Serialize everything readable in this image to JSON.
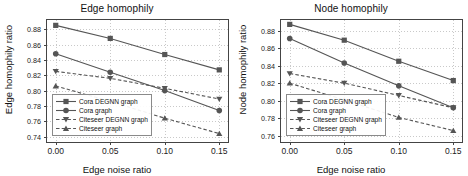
{
  "figure": {
    "panels": [
      {
        "id": "edge-homophily",
        "title": "Edge homophily",
        "xlabel": "Edge noise ratio",
        "ylabel": "Edge homophily ratio",
        "xticks": [
          "0.00",
          "0.05",
          "0.10",
          "0.15"
        ],
        "yticks": [
          "0.88",
          "0.86",
          "0.84",
          "0.82",
          "0.80",
          "0.78",
          "0.76",
          "0.74"
        ]
      },
      {
        "id": "node-homophily",
        "title": "Node homophily",
        "xlabel": "Edge noise ratio",
        "ylabel": "Node homophily ratio",
        "xticks": [
          "0.00",
          "0.05",
          "0.10",
          "0.15"
        ],
        "yticks": [
          "0.88",
          "0.86",
          "0.84",
          "0.82",
          "0.80",
          "0.78",
          "0.76"
        ]
      }
    ],
    "legend": [
      {
        "label": "Cora DEGNN graph",
        "marker": "square",
        "line": "solid",
        "color": "#555555"
      },
      {
        "label": "Cora graph",
        "marker": "circle",
        "line": "solid",
        "color": "#555555"
      },
      {
        "label": "Citeseer DEGNN graph",
        "marker": "triangle-down",
        "line": "dashed",
        "color": "#555555"
      },
      {
        "label": "Citeseer graph",
        "marker": "triangle-up",
        "line": "dashed",
        "color": "#555555"
      }
    ]
  },
  "chart_data": [
    {
      "type": "line",
      "title": "Edge homophily",
      "xlabel": "Edge noise ratio",
      "ylabel": "Edge homophily ratio",
      "x": [
        0.0,
        0.05,
        0.1,
        0.15
      ],
      "xlim": [
        -0.008,
        0.158
      ],
      "ylim": [
        0.733,
        0.892
      ],
      "grid": true,
      "legend_position": "lower left",
      "series": [
        {
          "name": "Cora DEGNN graph",
          "marker": "square",
          "line": "solid",
          "color": "#555555",
          "values": [
            0.885,
            0.868,
            0.847,
            0.827
          ]
        },
        {
          "name": "Cora graph",
          "marker": "circle",
          "line": "solid",
          "color": "#555555",
          "values": [
            0.848,
            0.824,
            0.8,
            0.774
          ]
        },
        {
          "name": "Citeseer DEGNN graph",
          "marker": "triangle-down",
          "line": "dashed",
          "color": "#555555",
          "values": [
            0.825,
            0.816,
            0.803,
            0.789
          ]
        },
        {
          "name": "Citeseer graph",
          "marker": "triangle-up",
          "line": "dashed",
          "color": "#555555",
          "values": [
            0.806,
            0.786,
            0.764,
            0.744
          ]
        }
      ]
    },
    {
      "type": "line",
      "title": "Node homophily",
      "xlabel": "Edge noise ratio",
      "ylabel": "Node homophily ratio",
      "x": [
        0.0,
        0.05,
        0.1,
        0.15
      ],
      "xlim": [
        -0.008,
        0.158
      ],
      "ylim": [
        0.753,
        0.892
      ],
      "grid": true,
      "legend_position": "lower left",
      "series": [
        {
          "name": "Cora DEGNN graph",
          "marker": "square",
          "line": "solid",
          "color": "#555555",
          "values": [
            0.887,
            0.869,
            0.845,
            0.823
          ]
        },
        {
          "name": "Cora graph",
          "marker": "circle",
          "line": "solid",
          "color": "#555555",
          "values": [
            0.871,
            0.843,
            0.817,
            0.792
          ]
        },
        {
          "name": "Citeseer DEGNN graph",
          "marker": "triangle-down",
          "line": "dashed",
          "color": "#555555",
          "values": [
            0.831,
            0.82,
            0.806,
            0.792
          ]
        },
        {
          "name": "Citeseer graph",
          "marker": "triangle-up",
          "line": "dashed",
          "color": "#555555",
          "values": [
            0.82,
            0.801,
            0.781,
            0.766
          ]
        }
      ]
    }
  ]
}
